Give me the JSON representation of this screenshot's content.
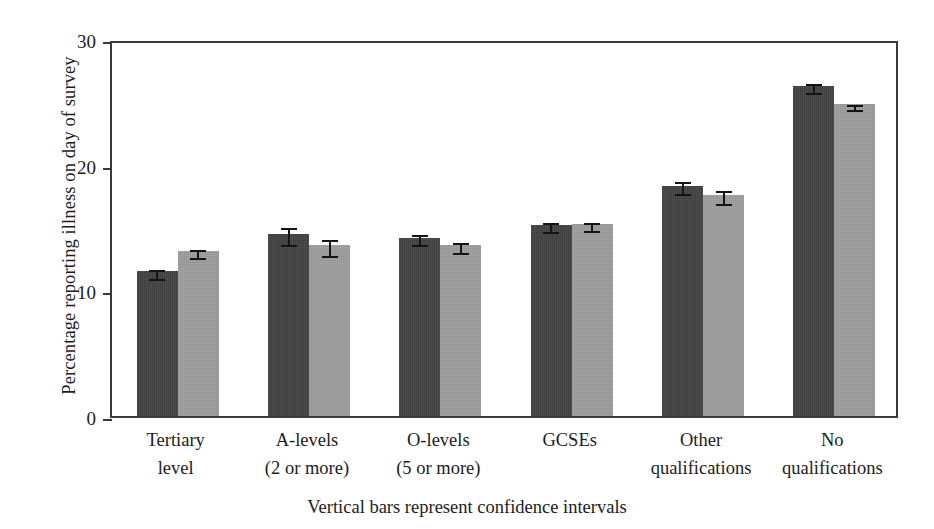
{
  "chart_data": {
    "type": "bar",
    "title": "",
    "xlabel": "",
    "ylabel": "Percentage reporting illness on day of survey",
    "caption": "Vertical bars represent confidence intervals",
    "categories": [
      "Tertiary level",
      "A-levels (2 or more)",
      "O-levels (5 or more)",
      "GCSEs",
      "Other qualifications",
      "No qualifications"
    ],
    "category_lines": [
      [
        "Tertiary",
        "level"
      ],
      [
        "A-levels",
        "(2 or more)"
      ],
      [
        "O-levels",
        "(5 or more)"
      ],
      [
        "GCSEs",
        ""
      ],
      [
        "Other",
        "qualifications"
      ],
      [
        "No",
        "qualifications"
      ]
    ],
    "series": [
      {
        "name": "Series 1",
        "color": "#3d3d3d",
        "values": [
          11.5,
          14.5,
          14.2,
          15.2,
          15.2,
          18.3
        ],
        "ci_low": [
          11.1,
          13.8,
          13.8,
          14.8,
          14.8,
          17.8
        ],
        "ci_high": [
          11.9,
          15.3,
          14.7,
          15.7,
          15.7,
          18.9
        ]
      },
      {
        "name": "Series 2",
        "color": "#9a9a9a",
        "values": [
          13.1,
          13.6,
          13.6,
          15.3,
          17.6,
          24.8
        ],
        "ci_low": [
          12.7,
          12.9,
          13.1,
          14.9,
          17.0,
          24.4
        ],
        "ci_high": [
          13.5,
          14.3,
          14.1,
          15.7,
          18.2,
          25.2
        ]
      }
    ],
    "bars": [
      {
        "category": "Tertiary level",
        "dark": 11.5,
        "dark_low": 11.1,
        "dark_high": 11.9,
        "light": 13.1,
        "light_low": 12.7,
        "light_high": 13.5
      },
      {
        "category": "A-levels (2 or more)",
        "dark": 14.5,
        "dark_low": 13.8,
        "dark_high": 15.3,
        "light": 13.6,
        "light_low": 12.9,
        "light_high": 14.3
      },
      {
        "category": "O-levels (5 or more)",
        "dark": 14.2,
        "dark_low": 13.8,
        "dark_high": 14.7,
        "light": 13.6,
        "light_low": 13.1,
        "light_high": 14.1
      },
      {
        "category": "GCSEs",
        "dark": 15.2,
        "dark_low": 14.8,
        "dark_high": 15.7,
        "light": 15.3,
        "light_low": 14.9,
        "light_high": 15.7
      },
      {
        "category": "Other qualifications",
        "dark": 18.3,
        "dark_low": 17.8,
        "dark_high": 18.9,
        "light": 17.6,
        "light_low": 17.0,
        "light_high": 18.2
      },
      {
        "category": "No qualifications",
        "dark": 26.3,
        "dark_low": 25.9,
        "dark_high": 26.7,
        "light": 24.8,
        "light_low": 24.5,
        "light_high": 25.1
      }
    ],
    "yticks": [
      0,
      10,
      20,
      30
    ],
    "ytick_labels": [
      "0",
      "10",
      "20",
      "30"
    ],
    "ylim": [
      0,
      30
    ],
    "grid": false,
    "legend": "none",
    "colors": {
      "dark_series": "#3d3d3d",
      "light_series": "#9a9a9a",
      "axis": "#3a3a3a",
      "error_bar": "#141414",
      "background": "#ffffff"
    }
  }
}
